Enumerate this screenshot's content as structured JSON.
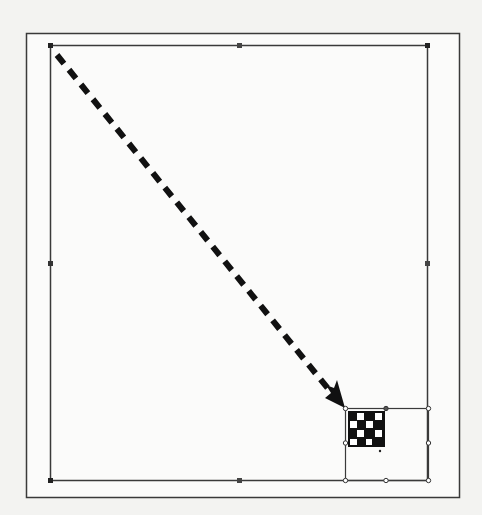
{
  "diagram": {
    "colors": {
      "background": "#f3f3f1",
      "page": "#fbfbfa",
      "stroke": "#3a3a3a",
      "arrow": "#111111",
      "handle": "#222222",
      "checker_dark": "#111111",
      "checker_light": "#ffffff"
    },
    "outer_frame": {
      "x": 26,
      "y": 33,
      "width": 433,
      "height": 464
    },
    "page_selection": {
      "x": 50,
      "y": 45,
      "width": 377,
      "height": 435,
      "handles": [
        "top-left",
        "top-middle",
        "top-right",
        "middle-left",
        "middle-right",
        "bottom-left",
        "bottom-middle",
        "bottom-right"
      ]
    },
    "object_selection": {
      "x": 345,
      "y": 408,
      "width": 83,
      "height": 72,
      "handles": [
        "top-left",
        "top-middle",
        "top-right",
        "middle-left",
        "middle-right",
        "bottom-left",
        "bottom-middle",
        "bottom-right"
      ]
    },
    "checkerboard": {
      "x": 348,
      "y": 411,
      "cols": 4,
      "rows": 4,
      "cell": 9
    },
    "arrow": {
      "style": "dashed",
      "from": [
        57,
        55
      ],
      "to": [
        344,
        407
      ]
    }
  }
}
